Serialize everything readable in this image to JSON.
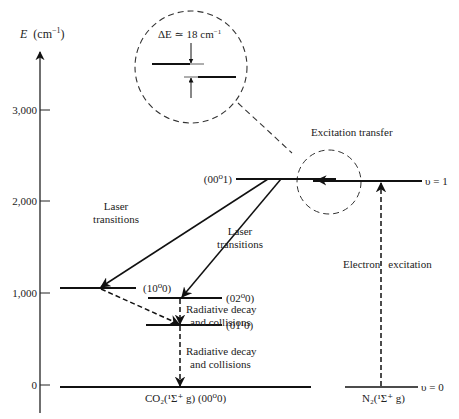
{
  "diagram": {
    "axis": {
      "label": "E (cm⁻¹)",
      "label_var": "E",
      "label_unit": "(cm",
      "label_exp": "−1",
      "label_close": ")",
      "ticks": [
        {
          "label": "3,000",
          "value": 3000
        },
        {
          "label": "2,000",
          "value": 2000
        },
        {
          "label": "1,000",
          "value": 1000
        },
        {
          "label": "0",
          "value": 0
        }
      ]
    },
    "inset": {
      "delta_label": "ΔE ≃ 18 cm",
      "delta_exp": "−1"
    },
    "levels": {
      "l0001": "(00⁰1)",
      "l1000": "(10⁰0)",
      "l0200": "(02⁰0)",
      "l0110": "(01¹0)",
      "co2_ground": "CO₂(¹Σ⁺ g) (00⁰0)",
      "n2_v1": "υ = 1",
      "n2_v0": "υ = 0",
      "n2_ground": "N₂(¹Σ⁺ g)"
    },
    "annotations": {
      "excitation_transfer": "Excitation transfer",
      "laser1_line1": "Laser",
      "laser1_line2": "transitions",
      "laser2_line1": "Laser",
      "laser2_line2": "transitions",
      "rad1_line1": "Radiative decay",
      "rad1_line2": "and collisions",
      "rad2_line1": "Radiative decay",
      "rad2_line2": "and collisions",
      "electron_excitation": "Electron excitation"
    }
  }
}
